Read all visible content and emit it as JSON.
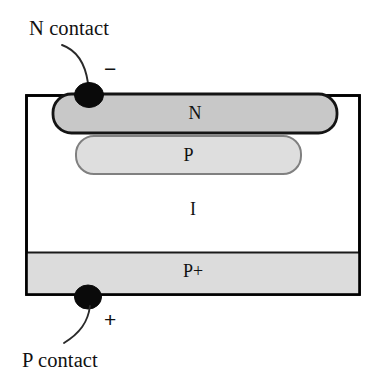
{
  "diagram": {
    "type": "semiconductor-cross-section",
    "background_color": "#ffffff",
    "outline_color": "#000000",
    "annotations": {
      "n_contact_label": "N contact",
      "p_contact_label": "P contact",
      "minus_sign": "−",
      "plus_sign": "+"
    },
    "layers": [
      {
        "key": "n",
        "label": "N",
        "shape": "rounded-bar",
        "fill_color": "#c8c8c8",
        "stroke_color": "#141414",
        "x": 52,
        "y": 93,
        "width": 286,
        "height": 41
      },
      {
        "key": "p",
        "label": "P",
        "shape": "rounded-bar",
        "fill_color": "#dedede",
        "stroke_color": "#7a7a7a",
        "x": 75,
        "y": 135,
        "width": 227,
        "height": 40
      },
      {
        "key": "i",
        "label": "I",
        "shape": "substrate",
        "fill_color": "#ffffff",
        "stroke_color": "#000000",
        "x": 26,
        "y": 95,
        "width": 334,
        "height": 200
      },
      {
        "key": "pplus",
        "label": "P+",
        "shape": "band",
        "fill_color": "#dcdcdc",
        "stroke_color": "#000000",
        "x": 26,
        "y": 252,
        "width": 334,
        "height": 43
      }
    ],
    "contacts": [
      {
        "key": "n-contact",
        "label": "N contact",
        "polarity": "−",
        "marker_color": "#0a0a0a",
        "cx": 89,
        "cy": 95,
        "rx": 14,
        "ry": 12,
        "position": "top"
      },
      {
        "key": "p-contact",
        "label": "P contact",
        "polarity": "+",
        "marker_color": "#0a0a0a",
        "cx": 88,
        "cy": 297,
        "rx": 13,
        "ry": 12,
        "position": "bottom"
      }
    ]
  }
}
